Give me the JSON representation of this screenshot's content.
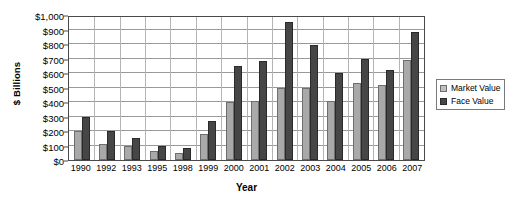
{
  "chart_data": {
    "type": "bar",
    "title": "",
    "xlabel": "Year",
    "ylabel": "$ Billions",
    "ylim": [
      0,
      1000
    ],
    "ytick_step": 100,
    "grid": true,
    "legend_position": "right",
    "categories": [
      "1990",
      "1992",
      "1993",
      "1995",
      "1998",
      "1999",
      "2000",
      "2001",
      "2002",
      "2003",
      "2004",
      "2005",
      "2006",
      "2007"
    ],
    "series": [
      {
        "name": "Market Value",
        "color": "#a9a9a9",
        "values": [
          200,
          110,
          100,
          65,
          50,
          180,
          400,
          405,
          500,
          500,
          405,
          530,
          520,
          690
        ]
      },
      {
        "name": "Face Value",
        "color": "#464646",
        "values": [
          300,
          200,
          155,
          100,
          80,
          270,
          650,
          680,
          950,
          790,
          600,
          700,
          620,
          880
        ]
      }
    ],
    "ytick_labels": [
      "$0",
      "$100",
      "$200",
      "$300",
      "$400",
      "$500",
      "$600",
      "$700",
      "$800",
      "$900",
      "$1,000"
    ]
  },
  "axes": {
    "y_title": "$ Billions",
    "x_title": "Year"
  },
  "legend": {
    "items": [
      {
        "label": "Market Value",
        "swatch": "market"
      },
      {
        "label": "Face Value",
        "swatch": "face"
      }
    ]
  }
}
